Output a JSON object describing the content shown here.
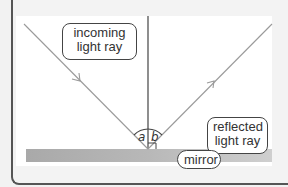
{
  "diagram": {
    "labels": {
      "incoming": "incoming light ray",
      "incoming_line1": "incoming",
      "incoming_line2": "light ray",
      "reflected_line1": "reflected",
      "reflected_line2": "light ray",
      "mirror": "mirror"
    },
    "angles": {
      "incidence": "a",
      "reflection": "b"
    },
    "colors": {
      "ray": "#9a9a9a",
      "normal": "#444444",
      "mirror_light": "#d4d4d4",
      "mirror_dark": "#a8a8a8",
      "frame": "#555555",
      "label_border": "#444444"
    }
  }
}
